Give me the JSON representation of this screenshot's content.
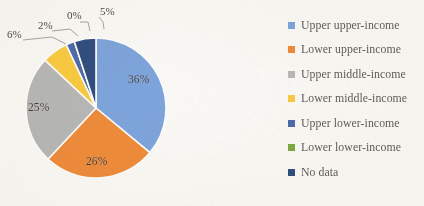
{
  "chart_data": {
    "type": "pie",
    "title": "",
    "categories": [
      "Upper upper-income",
      "Lower upper-income",
      "Upper middle-income",
      "Lower middle-income",
      "Upper lower-income",
      "Lower lower-income",
      "No data"
    ],
    "values": [
      36,
      26,
      25,
      6,
      2,
      0,
      5
    ],
    "value_labels": [
      "36%",
      "26%",
      "25%",
      "6%",
      "2%",
      "0%",
      "5%"
    ],
    "colors": [
      "#7ba3dd",
      "#f08a36",
      "#b7b7b7",
      "#fbcb3d",
      "#4a69a8",
      "#7ba93f",
      "#2b4a7d"
    ],
    "legend_position": "right",
    "grid": false,
    "start_angle_deg": 0,
    "direction": "clockwise",
    "labels_inside": [
      "36%",
      "26%",
      "25%"
    ],
    "labels_callout": [
      "6%",
      "2%",
      "0%",
      "5%"
    ]
  },
  "chart": {
    "slice_labels": [
      {
        "text": "36%",
        "left": 128,
        "top": 73
      },
      {
        "text": "26%",
        "left": 86,
        "top": 155
      },
      {
        "text": "25%",
        "left": 28,
        "top": 101
      }
    ],
    "callouts": [
      {
        "text": "6%",
        "left": 7,
        "top": 28
      },
      {
        "text": "2%",
        "left": 38,
        "top": 19
      },
      {
        "text": "0%",
        "left": 67,
        "top": 9
      },
      {
        "text": "5%",
        "left": 100,
        "top": 5
      }
    ]
  },
  "legend": {
    "items": [
      {
        "label": "Upper upper-income",
        "color": "#7ba3dd"
      },
      {
        "label": "Lower upper-income",
        "color": "#f08a36"
      },
      {
        "label": "Upper middle-income",
        "color": "#b7b7b7"
      },
      {
        "label": "Lower middle-income",
        "color": "#fbcb3d"
      },
      {
        "label": "Upper lower-income",
        "color": "#4a69a8"
      },
      {
        "label": "Lower lower-income",
        "color": "#7ba93f"
      },
      {
        "label": "No data",
        "color": "#2b4a7d"
      }
    ]
  }
}
